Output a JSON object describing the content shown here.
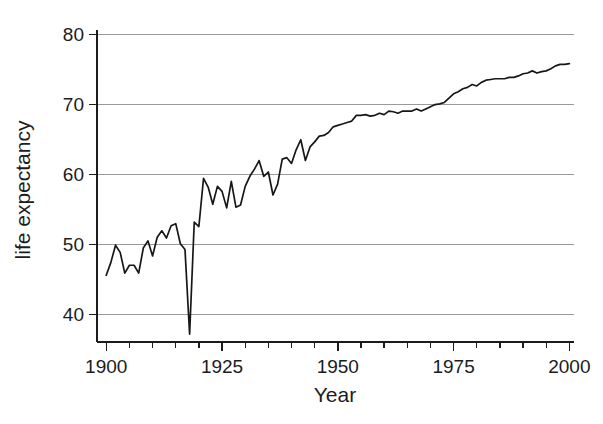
{
  "chart_data": {
    "type": "line",
    "title": "",
    "xlabel": "Year",
    "ylabel": "life expectancy",
    "xlim": [
      1898,
      2001
    ],
    "ylim": [
      38,
      81.5
    ],
    "grid": "horizontal",
    "legend": "none",
    "x_ticks_major": [
      1900,
      1925,
      1950,
      1975,
      2000
    ],
    "x_tick_labels": [
      "1900",
      "1925",
      "1950",
      "1975",
      "2000"
    ],
    "x_ticks_minor_step": 5,
    "y_ticks": [
      40,
      50,
      60,
      70,
      80
    ],
    "y_tick_labels": [
      "40",
      "50",
      "60",
      "70",
      "80"
    ],
    "line_color": "#171717",
    "grid_color": "#9a9a9a",
    "axis_color": "#1c1c1c",
    "series": [
      {
        "name": "life expectancy",
        "x": [
          1900,
          1901,
          1902,
          1903,
          1904,
          1905,
          1906,
          1907,
          1908,
          1909,
          1910,
          1911,
          1912,
          1913,
          1914,
          1915,
          1916,
          1917,
          1918,
          1919,
          1920,
          1921,
          1922,
          1923,
          1924,
          1925,
          1926,
          1927,
          1928,
          1929,
          1930,
          1931,
          1932,
          1933,
          1934,
          1935,
          1936,
          1937,
          1938,
          1939,
          1940,
          1941,
          1942,
          1943,
          1944,
          1945,
          1946,
          1947,
          1948,
          1949,
          1950,
          1951,
          1952,
          1953,
          1954,
          1955,
          1956,
          1957,
          1958,
          1959,
          1960,
          1961,
          1962,
          1963,
          1964,
          1965,
          1966,
          1967,
          1968,
          1969,
          1970,
          1971,
          1972,
          1973,
          1974,
          1975,
          1976,
          1977,
          1978,
          1979,
          1980,
          1981,
          1982,
          1983,
          1984,
          1985,
          1986,
          1987,
          1988,
          1989,
          1990,
          1991,
          1992,
          1993,
          1994,
          1995,
          1996,
          1997,
          1998,
          1999,
          2000
        ],
        "values": [
          47.3,
          49.1,
          51.5,
          50.5,
          47.6,
          48.7,
          48.7,
          47.6,
          51.1,
          52.1,
          50.0,
          52.6,
          53.5,
          52.5,
          54.2,
          54.5,
          51.7,
          50.9,
          39.1,
          54.7,
          54.1,
          60.8,
          59.6,
          57.2,
          59.7,
          59.0,
          56.7,
          60.4,
          56.8,
          57.1,
          59.7,
          61.1,
          62.1,
          63.3,
          61.1,
          61.7,
          58.5,
          60.0,
          63.5,
          63.7,
          62.9,
          64.8,
          66.2,
          63.3,
          65.2,
          65.9,
          66.7,
          66.8,
          67.2,
          68.0,
          68.2,
          68.4,
          68.6,
          68.8,
          69.6,
          69.6,
          69.7,
          69.5,
          69.6,
          69.9,
          69.7,
          70.2,
          70.1,
          69.9,
          70.2,
          70.2,
          70.2,
          70.5,
          70.2,
          70.5,
          70.8,
          71.1,
          71.2,
          71.4,
          72.0,
          72.6,
          72.9,
          73.3,
          73.5,
          73.9,
          73.7,
          74.2,
          74.5,
          74.6,
          74.7,
          74.7,
          74.7,
          74.9,
          74.9,
          75.1,
          75.4,
          75.5,
          75.8,
          75.5,
          75.7,
          75.8,
          76.1,
          76.5,
          76.7,
          76.7,
          76.8
        ],
        "annotations": [
          {
            "x": 1918,
            "y": 39.1,
            "note": "sharp minimum"
          },
          {
            "x": 2000,
            "y": 76.8,
            "note": "series end"
          }
        ]
      }
    ]
  }
}
